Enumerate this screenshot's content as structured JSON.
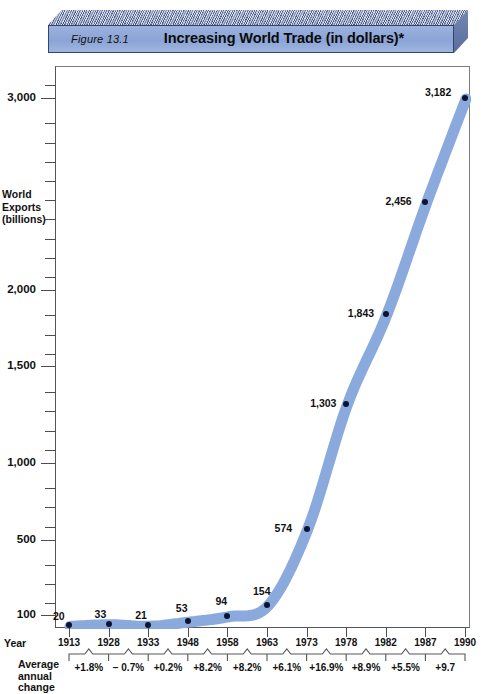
{
  "figure": {
    "label": "Figure 13.1",
    "title": "Increasing World Trade  (in dollars)*"
  },
  "colors": {
    "plaque_face": "#8ba4d6",
    "plaque_top": "#6d80ad",
    "line": "#8aa9dd",
    "dot": "#0d1433",
    "axis": "#55565a"
  },
  "axes": {
    "y_title": "World\nExports\n(billions)",
    "y_title_lines": [
      "World",
      "Exports",
      "(billions)"
    ],
    "y_ticklabels": [
      "3,000",
      "2,000",
      "1,500",
      "1,000",
      "500",
      "100"
    ],
    "y_tickvalues": [
      3000,
      2000,
      1500,
      1000,
      500,
      100
    ],
    "x_title": "Year",
    "aac_title_lines": [
      "Average",
      "annual",
      "change"
    ]
  },
  "chart_data": {
    "type": "line",
    "title": "Increasing World Trade  (in dollars)*",
    "xlabel": "Year",
    "ylabel": "World Exports (billions)",
    "grid": false,
    "legend": false,
    "ylim": [
      0,
      3300
    ],
    "ytick_labels": [
      "100",
      "500",
      "1,000",
      "1,500",
      "2,000",
      "3,000"
    ],
    "categories": [
      "1913",
      "1928",
      "1933",
      "1948",
      "1958",
      "1963",
      "1973",
      "1978",
      "1982",
      "1987",
      "1990"
    ],
    "values": [
      20,
      33,
      21,
      53,
      94,
      154,
      574,
      1303,
      1843,
      2456,
      3182
    ],
    "point_labels": [
      "20",
      "33",
      "21",
      "53",
      "94",
      "154",
      "574",
      "1,303",
      "1,843",
      "2,456",
      "3,182"
    ],
    "annotations": {
      "average_annual_change_label": "Average annual change",
      "average_annual_change": [
        "+1.8%",
        "− 0.7%",
        "+0.2%",
        "+8.2%",
        "+8.2%",
        "+6.1%",
        "+16.9%",
        "+8.9%",
        "+5.5%",
        "+9.7"
      ]
    }
  }
}
